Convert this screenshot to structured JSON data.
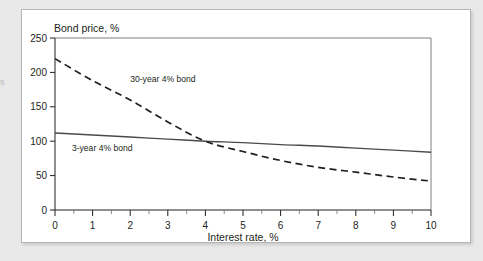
{
  "page": {
    "margin_fragment": "s",
    "background_color": "#e9e9e9",
    "panel_color": "#ffffff",
    "panel_border_color": "#b5b5b5"
  },
  "chart_data": {
    "type": "line",
    "title": "",
    "ylabel": "Bond price, %",
    "xlabel": "Interest rate, %",
    "xlim": [
      0,
      10
    ],
    "ylim": [
      0,
      250
    ],
    "grid": false,
    "legend_position": "inline-annotation",
    "xticks": [
      0,
      1,
      2,
      3,
      4,
      5,
      6,
      7,
      8,
      9,
      10
    ],
    "xtick_labels": [
      "0",
      "1",
      "2",
      "3",
      "4",
      "5",
      "6",
      "7",
      "8",
      "9",
      "10"
    ],
    "xminor_ticks": [
      0.5,
      1.5,
      2.5,
      3.5,
      4.5,
      5.5,
      6.5,
      7.5,
      8.5,
      9.5
    ],
    "yticks": [
      0,
      50,
      100,
      150,
      200,
      250
    ],
    "ytick_labels": [
      "0",
      "50",
      "100",
      "150",
      "200",
      "250"
    ],
    "x": [
      0,
      1,
      2,
      3,
      4,
      5,
      6,
      7,
      8,
      9,
      10
    ],
    "series": [
      {
        "name": "30-year 4% bond",
        "style": "dashed",
        "color": "#231f20",
        "values": [
          220,
          188,
          160,
          128,
          100,
          85,
          72,
          62,
          55,
          48,
          42
        ],
        "label_x": 2.0,
        "label_y": 186
      },
      {
        "name": "3-year 4% bond",
        "style": "solid",
        "color": "#4a4a4a",
        "values": [
          112,
          109,
          106,
          103,
          100,
          98,
          95,
          93,
          90,
          87,
          84
        ],
        "label_x": 0.45,
        "label_y": 86
      }
    ],
    "annotations": [
      {
        "text": "30-year 4% bond"
      },
      {
        "text": "3-year 4% bond"
      }
    ]
  }
}
